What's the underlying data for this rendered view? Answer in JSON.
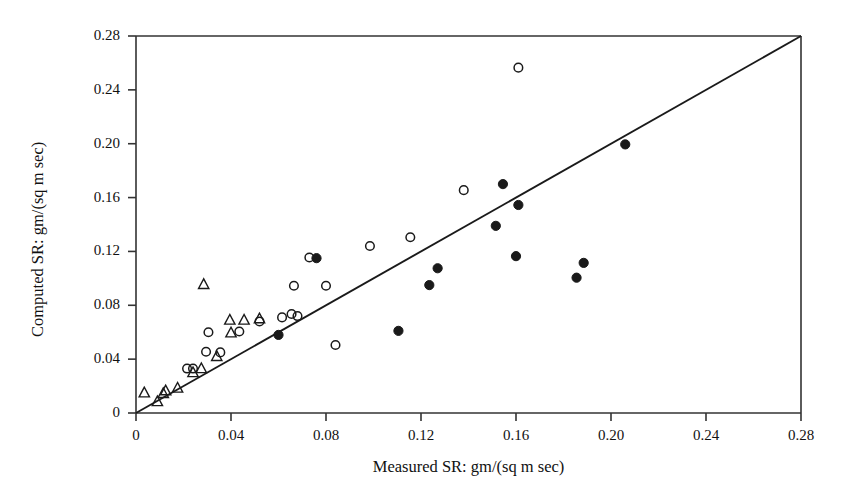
{
  "chart_data": {
    "type": "scatter",
    "title": "",
    "xlabel": "Measured SR: gm/(sq m sec)",
    "ylabel": "Computed SR: gm/(sq m sec)",
    "xlim": [
      0,
      0.28
    ],
    "ylim": [
      0,
      0.28
    ],
    "xticks": [
      0,
      0.04,
      0.08,
      0.12,
      0.16,
      0.2,
      0.24,
      0.28
    ],
    "yticks": [
      0,
      0.04,
      0.08,
      0.12,
      0.16,
      0.2,
      0.24,
      0.28
    ],
    "xtick_labels": [
      "0",
      "0.04",
      "0.08",
      "0.12",
      "0.16",
      "0.20",
      "0.24",
      "0.28"
    ],
    "ytick_labels": [
      "0",
      "0.04",
      "0.08",
      "0.12",
      "0.16",
      "0.20",
      "0.24",
      "0.28"
    ],
    "grid": false,
    "legend": "none",
    "axis_color": "#333333",
    "marker_color": "#1a1a1a",
    "reference_line": {
      "name": "one-to-one-line",
      "from": [
        0,
        0
      ],
      "to": [
        0.28,
        0.28
      ],
      "color": "#1a1a1a"
    },
    "series": [
      {
        "name": "open-circle",
        "marker": "open circle",
        "points": [
          [
            0.0215,
            0.033
          ],
          [
            0.024,
            0.033
          ],
          [
            0.0295,
            0.0455
          ],
          [
            0.0355,
            0.045
          ],
          [
            0.0305,
            0.06
          ],
          [
            0.0435,
            0.0605
          ],
          [
            0.052,
            0.068
          ],
          [
            0.0615,
            0.071
          ],
          [
            0.0655,
            0.0735
          ],
          [
            0.068,
            0.072
          ],
          [
            0.0665,
            0.0945
          ],
          [
            0.08,
            0.0945
          ],
          [
            0.073,
            0.1155
          ],
          [
            0.084,
            0.0505
          ],
          [
            0.0985,
            0.124
          ],
          [
            0.1155,
            0.1305
          ],
          [
            0.138,
            0.1655
          ],
          [
            0.161,
            0.2565
          ]
        ]
      },
      {
        "name": "open-triangle",
        "marker": "open triangle",
        "points": [
          [
            0.0035,
            0.015
          ],
          [
            0.009,
            0.0085
          ],
          [
            0.0115,
            0.0145
          ],
          [
            0.0125,
            0.0165
          ],
          [
            0.0175,
            0.0185
          ],
          [
            0.024,
            0.03
          ],
          [
            0.0275,
            0.033
          ],
          [
            0.0285,
            0.0955
          ],
          [
            0.034,
            0.042
          ],
          [
            0.04,
            0.0595
          ],
          [
            0.0395,
            0.069
          ],
          [
            0.0455,
            0.069
          ],
          [
            0.052,
            0.07
          ]
        ]
      },
      {
        "name": "filled-circle",
        "marker": "filled circle",
        "points": [
          [
            0.06,
            0.058
          ],
          [
            0.076,
            0.115
          ],
          [
            0.1105,
            0.061
          ],
          [
            0.1235,
            0.095
          ],
          [
            0.127,
            0.1075
          ],
          [
            0.1515,
            0.139
          ],
          [
            0.1545,
            0.17
          ],
          [
            0.161,
            0.1545
          ],
          [
            0.16,
            0.1165
          ],
          [
            0.1855,
            0.1005
          ],
          [
            0.1885,
            0.1115
          ],
          [
            0.206,
            0.1995
          ]
        ]
      }
    ]
  }
}
